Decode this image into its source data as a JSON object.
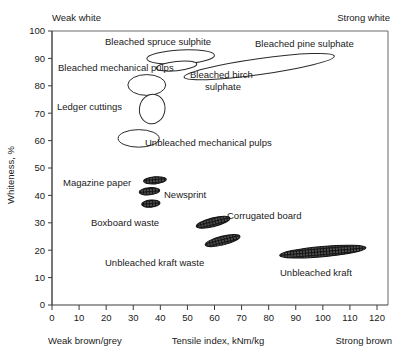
{
  "chart_data": {
    "type": "scatter",
    "title": "",
    "xlabel": "Tensile index, kNm/kg",
    "ylabel": "Whiteness, %",
    "xlim": [
      0,
      124
    ],
    "ylim": [
      0,
      100
    ],
    "grid": false,
    "legend_position": "none",
    "xticks": [
      "0",
      "10",
      "20",
      "30",
      "40",
      "50",
      "60",
      "70",
      "80",
      "90",
      "100",
      "110",
      "120"
    ],
    "xtick_values": [
      0,
      10,
      20,
      30,
      40,
      50,
      60,
      70,
      80,
      90,
      100,
      110,
      120
    ],
    "yticks": [
      "0",
      "10",
      "20",
      "30",
      "40",
      "50",
      "60",
      "70",
      "80",
      "90",
      "100"
    ],
    "ytick_values": [
      0,
      10,
      20,
      30,
      40,
      50,
      60,
      70,
      80,
      90,
      100
    ],
    "corner_annotations": {
      "top_left": "Weak white",
      "top_right": "Strong white",
      "bottom_left": "Weak brown/grey",
      "bottom_right": "Strong brown"
    },
    "series": [
      {
        "name": "Bleached spruce sulphite",
        "style": "open",
        "cx": 47.5,
        "cy": 90.5,
        "rx": 12.5,
        "ry": 2.6,
        "rot": -3,
        "label": "Bleached spruce sulphite",
        "label_x": 105,
        "label_y": 45,
        "label_anchor": "start"
      },
      {
        "name": "Bleached birch sulphate",
        "style": "open",
        "cx": 46.0,
        "cy": 87.2,
        "rx": 7.5,
        "ry": 1.7,
        "rot": -6,
        "label": "Bleached birch",
        "label_x": 190,
        "label_y": 78,
        "label_anchor": "start",
        "label2": "sulphate",
        "label2_x": 205,
        "label2_y": 90
      },
      {
        "name": "Bleached pine sulphate",
        "style": "open",
        "cx": 76.5,
        "cy": 87.0,
        "rx": 28.0,
        "ry": 2.9,
        "rot": -8,
        "label": "Bleached pine sulphate",
        "label_x": 255,
        "label_y": 47,
        "label_anchor": "start"
      },
      {
        "name": "Bleached mechanical pulps",
        "style": "open",
        "cx": 35.0,
        "cy": 80.3,
        "rx": 7.0,
        "ry": 3.8,
        "rot": 0,
        "label": "Bleached mechanical pulps",
        "label_x": 58,
        "label_y": 71,
        "label_anchor": "start"
      },
      {
        "name": "Ledger cuttings",
        "style": "open",
        "cx": 37.0,
        "cy": 71.5,
        "rx": 4.7,
        "ry": 5.4,
        "rot": 10,
        "label": "Ledger cuttings",
        "label_x": 57,
        "label_y": 110,
        "label_anchor": "start"
      },
      {
        "name": "Unbleached mechanical pulps",
        "style": "open",
        "cx": 32.0,
        "cy": 60.8,
        "rx": 7.6,
        "ry": 3.2,
        "rot": 0,
        "label": "Unbleached mechanical pulps",
        "label_x": 145,
        "label_y": 146,
        "label_anchor": "start"
      },
      {
        "name": "Magazine paper",
        "style": "hatched",
        "cx": 38.0,
        "cy": 45.5,
        "rx": 4.2,
        "ry": 1.3,
        "rot": -5,
        "label": "Magazine paper",
        "label_x": 63,
        "label_y": 186,
        "label_anchor": "start"
      },
      {
        "name": "Newsprint",
        "style": "hatched",
        "cx": 36.0,
        "cy": 41.5,
        "rx": 3.8,
        "ry": 1.3,
        "rot": -5,
        "label": "Newsprint",
        "label_x": 164,
        "label_y": 198,
        "label_anchor": "start"
      },
      {
        "name": "Boxboard waste",
        "style": "hatched",
        "cx": 36.5,
        "cy": 37.0,
        "rx": 3.4,
        "ry": 1.3,
        "rot": -5,
        "label": "Boxboard waste",
        "label_x": 91,
        "label_y": 226,
        "label_anchor": "start"
      },
      {
        "name": "Corrugated board",
        "style": "hatched",
        "cx": 59.5,
        "cy": 30.2,
        "rx": 6.4,
        "ry": 1.6,
        "rot": -14,
        "label": "Corrugated board",
        "label_x": 227,
        "label_y": 219,
        "label_anchor": "start"
      },
      {
        "name": "Unbleached kraft waste",
        "style": "hatched",
        "cx": 63.0,
        "cy": 23.5,
        "rx": 6.6,
        "ry": 1.6,
        "rot": -14,
        "label": "Unbleached kraft waste",
        "label_x": 105,
        "label_y": 266,
        "label_anchor": "start"
      },
      {
        "name": "Unbleached kraft",
        "style": "hatched",
        "cx": 100.0,
        "cy": 19.5,
        "rx": 16.0,
        "ry": 1.9,
        "rot": -5,
        "label": "Unbleached kraft",
        "label_x": 280,
        "label_y": 276,
        "label_anchor": "start"
      }
    ]
  }
}
